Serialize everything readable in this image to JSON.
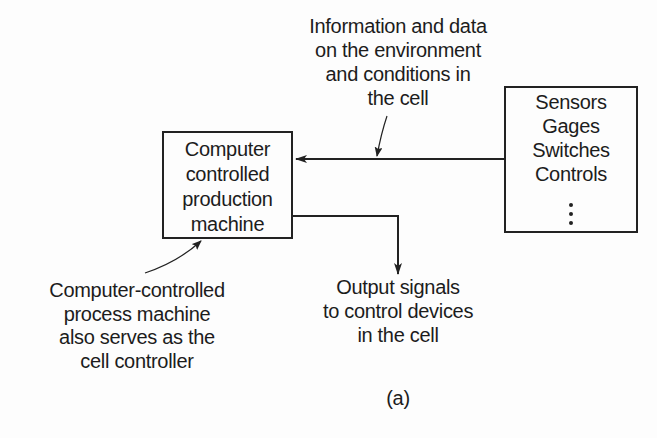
{
  "diagram": {
    "caption": "(a)",
    "top_annotation": {
      "lines": [
        "Information and data",
        "on the environment",
        "and conditions in",
        "the cell"
      ]
    },
    "machine_box": {
      "lines": [
        "Computer",
        "controlled",
        "production",
        "machine"
      ]
    },
    "devices_box": {
      "lines": [
        "Sensors",
        "Gages",
        "Switches",
        "Controls"
      ],
      "continuation": "⋮"
    },
    "machine_annotation": {
      "lines": [
        "Computer-controlled",
        "process machine",
        "also serves as the",
        "cell controller"
      ]
    },
    "output_annotation": {
      "lines": [
        "Output signals",
        "to control devices",
        "in the cell"
      ]
    },
    "connections": [
      {
        "from": "devices_box",
        "to": "machine_box",
        "meaning": "input information flow"
      },
      {
        "from": "machine_box",
        "to": "output_annotation",
        "meaning": "output signals"
      }
    ],
    "colors": {
      "line": "#222222",
      "text": "#1c1c1c",
      "background": "#fdfdfd"
    }
  }
}
